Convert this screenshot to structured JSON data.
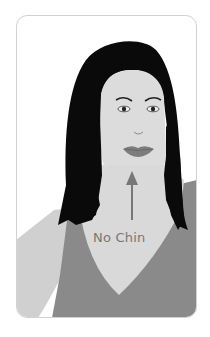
{
  "illustration": {
    "subject": "woman-face-front-view",
    "annotation": {
      "label": "No Chin",
      "arrow_direction": "up"
    }
  },
  "colors": {
    "background": "#ffffff",
    "card_border": "#d2d2d2",
    "hair": "#0a0a0a",
    "skin": "#d9d9d9",
    "skin_shoulder": "#cfcfcf",
    "shirt": "#8a8a8a",
    "lips": "#7d7d7d",
    "arrow": "#777777",
    "label": "#777777"
  }
}
